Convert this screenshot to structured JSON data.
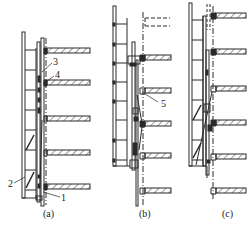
{
  "diagram": {
    "type": "construction-sequence",
    "panels": [
      {
        "id": "a",
        "caption": "(a)",
        "callouts": [
          {
            "num": "1",
            "x": 62,
            "y": 199
          },
          {
            "num": "2",
            "x": 10,
            "y": 185
          },
          {
            "num": "3",
            "x": 53,
            "y": 65
          },
          {
            "num": "4",
            "x": 55,
            "y": 77
          }
        ]
      },
      {
        "id": "b",
        "caption": "(b)",
        "callouts": [
          {
            "num": "5",
            "x": 162,
            "y": 104
          }
        ]
      },
      {
        "id": "c",
        "caption": "(c)",
        "callouts": []
      }
    ],
    "colors": {
      "line": "#2a2a2a",
      "hatch": "#3a3a3a",
      "background": "#ffffff"
    }
  }
}
